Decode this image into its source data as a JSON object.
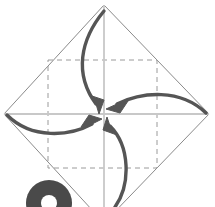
{
  "canvas": {
    "width": 215,
    "height": 207,
    "background": "#ffffff",
    "title": "Origami fold step: four corners to center"
  },
  "colors": {
    "paper_outline": "#8a8a8a",
    "crease_dashed": "#9a9a9a",
    "crease_center": "#c8c8c8",
    "arrow": "#555555",
    "step_number": "#4a4a4a"
  },
  "shapes": {
    "paper_diamond": {
      "name": "square-sheet-rotated",
      "vertices": [
        {
          "label": "top",
          "x": 104,
          "y": 5
        },
        {
          "label": "right",
          "x": 209,
          "y": 114
        },
        {
          "label": "bottom",
          "x": 104,
          "y": 223
        },
        {
          "label": "left",
          "x": 4,
          "y": 114
        }
      ],
      "stroke_width": 1
    },
    "inner_dashed_square": {
      "name": "crease-square",
      "left": 48,
      "top": 60,
      "right": 157,
      "bottom": 168,
      "dash": "5,4",
      "stroke_width": 1
    },
    "center_axes": {
      "name": "center-crease-lines",
      "center": {
        "x": 104,
        "y": 114
      },
      "horizontal": {
        "x1": 4,
        "y1": 114,
        "x2": 209,
        "y2": 114
      },
      "vertical": {
        "x1": 104,
        "y1": 5,
        "x2": 104,
        "y2": 207
      },
      "stroke_width": 1.6
    },
    "step_badge": {
      "name": "step-number-glyph",
      "center": {
        "x": 49,
        "y": 203
      },
      "outer_radius": 23,
      "inner_radius": 8,
      "note": "partially cropped numeral at bottom edge"
    }
  },
  "arrows": [
    {
      "id": "arrow-top-to-center",
      "label": "fold top corner to center",
      "from": {
        "x": 104,
        "y": 10
      },
      "to": {
        "x": 99,
        "y": 108
      },
      "curve_control": {
        "x": 76,
        "y": 58
      },
      "head_angle_deg": 100
    },
    {
      "id": "arrow-right-to-center",
      "label": "fold right corner to center",
      "from": {
        "x": 204,
        "y": 112
      },
      "to": {
        "x": 111,
        "y": 108
      },
      "curve_control": {
        "x": 156,
        "y": 88
      },
      "head_angle_deg": 192
    },
    {
      "id": "arrow-left-to-center",
      "label": "fold left corner to center",
      "from": {
        "x": 8,
        "y": 116
      },
      "to": {
        "x": 98,
        "y": 119
      },
      "curve_control": {
        "x": 52,
        "y": 138
      },
      "head_angle_deg": 14
    },
    {
      "id": "arrow-bottom-to-center",
      "label": "fold bottom corner to center",
      "from": {
        "x": 113,
        "y": 207
      },
      "to": {
        "x": 106,
        "y": 120
      },
      "curve_control": {
        "x": 128,
        "y": 166
      },
      "head_angle_deg": 281
    }
  ]
}
